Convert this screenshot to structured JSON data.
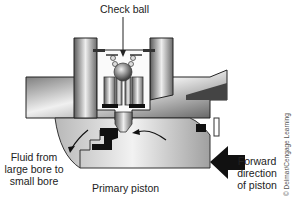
{
  "diagram": {
    "labels": {
      "check_ball": "Check ball",
      "fluid_line1": "Fluid from",
      "fluid_line2": "large bore to",
      "fluid_line3": "small bore",
      "primary_piston": "Primary piston",
      "forward_line1": "Forward",
      "forward_line2": "direction",
      "forward_line3": "of piston"
    },
    "copyright": "© Delmar/Cengage Learning",
    "colors": {
      "metal_dark": "#555555",
      "metal_light": "#e6e6e6",
      "seal": "#1a1a1a",
      "arrow": "#222222",
      "text": "#222222"
    }
  }
}
